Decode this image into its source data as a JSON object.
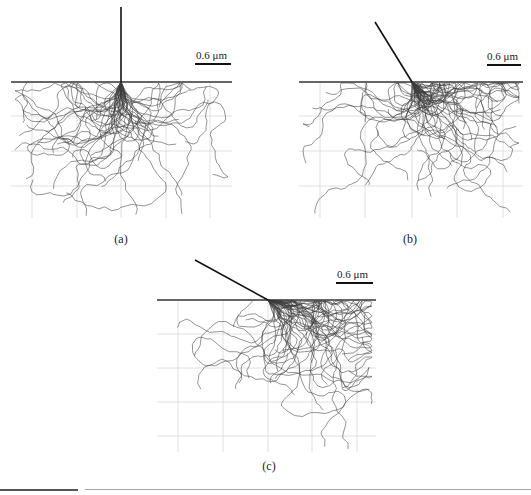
{
  "figure": {
    "panels": [
      {
        "id": "a",
        "caption": "(a)",
        "scale_bar_label": "0.6 μm",
        "surface": {
          "x1": 11,
          "x2": 232,
          "y": 82
        },
        "beam": {
          "x1": 121,
          "y1": 7,
          "x2": 121,
          "y2": 82
        },
        "impact": {
          "x": 121,
          "y": 82
        },
        "grid": {
          "xs": [
            32,
            77,
            121,
            166,
            210
          ],
          "ys": [
            116,
            151,
            186
          ],
          "x1": 11,
          "x2": 232,
          "y1": 82,
          "y2": 218
        },
        "scale_bar": {
          "x1": 195,
          "x2": 231,
          "y": 64,
          "label_x": 196,
          "label_y": 49
        },
        "caption_pos": {
          "x": 101,
          "y": 232
        },
        "entry_angle_deg": 90,
        "seed": 11
      },
      {
        "id": "b",
        "caption": "(b)",
        "scale_bar_label": "0.6 μm",
        "surface": {
          "x1": 299,
          "x2": 523,
          "y": 82
        },
        "beam": {
          "x1": 375,
          "y1": 22,
          "x2": 412,
          "y2": 82
        },
        "impact": {
          "x": 412,
          "y": 82
        },
        "grid": {
          "xs": [
            320,
            365,
            412,
            457,
            503
          ],
          "ys": [
            116,
            151,
            186
          ],
          "x1": 299,
          "x2": 523,
          "y1": 82,
          "y2": 218
        },
        "scale_bar": {
          "x1": 487,
          "x2": 521,
          "y": 65,
          "label_x": 487,
          "label_y": 50
        },
        "caption_pos": {
          "x": 390,
          "y": 232
        },
        "entry_angle_deg": 58,
        "seed": 23
      },
      {
        "id": "c",
        "caption": "(c)",
        "scale_bar_label": "0.6 μm",
        "surface": {
          "x1": 157,
          "x2": 376,
          "y": 300
        },
        "beam": {
          "x1": 195,
          "y1": 260,
          "x2": 268,
          "y2": 300
        },
        "impact": {
          "x": 268,
          "y": 300
        },
        "grid": {
          "xs": [
            178,
            223,
            268,
            312,
            357
          ],
          "ys": [
            334,
            368,
            402,
            436
          ],
          "x1": 157,
          "x2": 376,
          "y1": 300,
          "y2": 452
        },
        "scale_bar": {
          "x1": 336,
          "x2": 373,
          "y": 283,
          "label_x": 337,
          "label_y": 268
        },
        "caption_pos": {
          "x": 249,
          "y": 459
        },
        "entry_angle_deg": 29,
        "seed": 37
      }
    ],
    "trajectory_count_per_panel": 45,
    "colors": {
      "surface_line": "#333333",
      "beam_line": "#111111",
      "grid_line": "#d8d8d8",
      "trajectory": "#3a3a3a",
      "scale_bar": "#111111"
    }
  }
}
